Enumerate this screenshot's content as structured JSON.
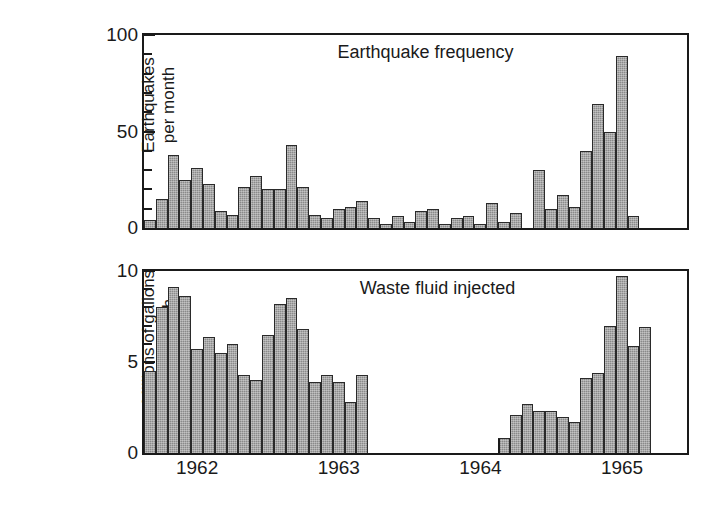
{
  "figure": {
    "background": "#ffffff",
    "bar_fill": "#8a8a8a",
    "bar_stroke": "#2a2a2a",
    "axis_color": "#1a1a1a"
  },
  "panels": [
    {
      "id": "top",
      "heading": "Earthquake frequency",
      "ylabel": "Earthquakes\nper month",
      "ytick_labels": [
        "0",
        "50",
        "100"
      ]
    },
    {
      "id": "bottom",
      "heading": "Waste fluid injected",
      "ylabel": "Millions of gallons\nper month",
      "ytick_labels": [
        "0",
        "5",
        "10"
      ]
    }
  ],
  "xaxis": {
    "tick_labels": [
      "1962",
      "1963",
      "1964",
      "1965"
    ]
  },
  "chart_data": [
    {
      "type": "bar",
      "title": "Earthquake frequency",
      "xlabel": "",
      "ylabel": "Earthquakes per month",
      "ylim": [
        0,
        100
      ],
      "ymajor_ticks": [
        0,
        50,
        100
      ],
      "yminor_ticks": [
        10,
        20,
        30,
        40,
        60,
        70,
        80,
        90
      ],
      "grid": false,
      "legend": "none",
      "x_tick_labels": [
        "1962",
        "1963",
        "1964",
        "1965"
      ],
      "x_tick_positions_month_index": [
        4,
        16,
        28,
        40
      ],
      "categories": [
        "1961-09",
        "1961-10",
        "1961-11",
        "1961-12",
        "1962-01",
        "1962-02",
        "1962-03",
        "1962-04",
        "1962-05",
        "1962-06",
        "1962-07",
        "1962-08",
        "1962-09",
        "1962-10",
        "1962-11",
        "1962-12",
        "1963-01",
        "1963-02",
        "1963-03",
        "1963-04",
        "1963-05",
        "1963-06",
        "1963-07",
        "1963-08",
        "1963-09",
        "1963-10",
        "1963-11",
        "1963-12",
        "1964-01",
        "1964-02",
        "1964-03",
        "1964-04",
        "1964-05",
        "1964-06",
        "1964-07",
        "1964-08",
        "1964-09",
        "1964-10",
        "1964-11",
        "1964-12",
        "1965-01",
        "1965-02",
        "1965-03",
        "1965-04",
        "1965-05",
        "1965-06"
      ],
      "values": [
        4,
        15,
        38,
        25,
        31,
        23,
        9,
        7,
        21,
        27,
        20,
        20,
        43,
        21,
        7,
        5,
        10,
        11,
        14,
        5,
        2,
        6,
        3,
        9,
        10,
        2,
        5,
        6,
        2,
        13,
        3,
        8,
        0,
        30,
        10,
        17,
        11,
        40,
        64,
        50,
        89,
        6,
        0,
        0,
        0,
        0
      ],
      "notes": "Monthly count of earthquakes near Denver, Colorado"
    },
    {
      "type": "bar",
      "title": "Waste fluid injected",
      "xlabel": "",
      "ylabel": "Millions of gallons per month",
      "ylim": [
        0,
        10
      ],
      "ymajor_ticks": [
        0,
        5,
        10
      ],
      "yminor_ticks": [
        1,
        2,
        3,
        4,
        6,
        7,
        8,
        9
      ],
      "grid": false,
      "legend": "none",
      "x_tick_labels": [
        "1962",
        "1963",
        "1964",
        "1965"
      ],
      "x_tick_positions_month_index": [
        4,
        16,
        28,
        40
      ],
      "categories": [
        "1961-09",
        "1961-10",
        "1961-11",
        "1961-12",
        "1962-01",
        "1962-02",
        "1962-03",
        "1962-04",
        "1962-05",
        "1962-06",
        "1962-07",
        "1962-08",
        "1962-09",
        "1962-10",
        "1962-11",
        "1962-12",
        "1963-01",
        "1963-02",
        "1963-03",
        "1963-04",
        "1963-05",
        "1963-06",
        "1963-07",
        "1963-08",
        "1963-09",
        "1963-10",
        "1963-11",
        "1963-12",
        "1964-01",
        "1964-02",
        "1964-03",
        "1964-04",
        "1964-05",
        "1964-06",
        "1964-07",
        "1964-08",
        "1964-09",
        "1964-10",
        "1964-11",
        "1964-12",
        "1965-01",
        "1965-02",
        "1965-03",
        "1965-04",
        "1965-05",
        "1965-06"
      ],
      "values": [
        4.5,
        8.0,
        9.1,
        8.6,
        5.7,
        6.4,
        5.5,
        6.0,
        4.3,
        4.0,
        6.5,
        8.2,
        8.5,
        6.8,
        3.9,
        4.3,
        3.9,
        2.8,
        4.3,
        0,
        0,
        0,
        0,
        0,
        0,
        0,
        0,
        0,
        0,
        0,
        0.8,
        2.1,
        2.7,
        2.3,
        2.3,
        2.0,
        1.7,
        4.1,
        4.4,
        7.0,
        9.7,
        5.9,
        6.9,
        0,
        0,
        0
      ],
      "notes": "Waste fluid injected at Rocky Mountain Arsenal deep well; injection halted Feb 1966"
    }
  ]
}
